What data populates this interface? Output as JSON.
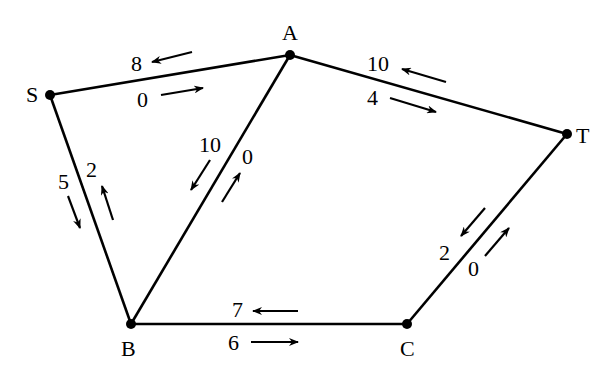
{
  "diagram": {
    "type": "flow-network",
    "nodes": [
      {
        "id": "S",
        "label": "S",
        "x": 50,
        "y": 95,
        "lx": 26,
        "ly": 102
      },
      {
        "id": "A",
        "label": "A",
        "x": 290,
        "y": 55,
        "lx": 282,
        "ly": 40
      },
      {
        "id": "T",
        "label": "T",
        "x": 567,
        "y": 134,
        "lx": 576,
        "ly": 143
      },
      {
        "id": "B",
        "label": "B",
        "x": 131,
        "y": 324,
        "lx": 121,
        "ly": 356
      },
      {
        "id": "C",
        "label": "C",
        "x": 407,
        "y": 324,
        "lx": 400,
        "ly": 356
      }
    ],
    "edges": [
      {
        "from": "S",
        "to": "A",
        "labels": [
          {
            "text": "8",
            "x": 131,
            "y": 71,
            "arrow": [
              192,
              52,
              152,
              62
            ]
          },
          {
            "text": "0",
            "x": 137,
            "y": 107,
            "arrow": [
              161,
              95,
              203,
              88
            ]
          }
        ]
      },
      {
        "from": "A",
        "to": "T",
        "labels": [
          {
            "text": "10",
            "x": 367,
            "y": 71,
            "arrow": [
              446,
              82,
              402,
              69
            ]
          },
          {
            "text": "4",
            "x": 367,
            "y": 105,
            "arrow": [
              390,
              98,
              436,
              112
            ]
          }
        ]
      },
      {
        "from": "S",
        "to": "B",
        "labels": [
          {
            "text": "5",
            "x": 58,
            "y": 189,
            "arrow": [
              68,
              196,
              80,
              228
            ]
          },
          {
            "text": "2",
            "x": 86,
            "y": 177,
            "arrow": [
              113,
              220,
              102,
              186
            ]
          }
        ]
      },
      {
        "from": "A",
        "to": "B",
        "labels": [
          {
            "text": "10",
            "x": 199,
            "y": 152,
            "arrow": [
              210,
              160,
              191,
              190
            ]
          },
          {
            "text": "0",
            "x": 242,
            "y": 164,
            "arrow": [
              222,
              202,
              240,
              173
            ]
          }
        ]
      },
      {
        "from": "B",
        "to": "C",
        "labels": [
          {
            "text": "7",
            "x": 232,
            "y": 317,
            "arrow": [
              298,
              311,
              253,
              311
            ]
          },
          {
            "text": "6",
            "x": 228,
            "y": 350,
            "arrow": [
              251,
              342,
              298,
              342
            ]
          }
        ]
      },
      {
        "from": "T",
        "to": "C",
        "labels": [
          {
            "text": "2",
            "x": 439,
            "y": 260,
            "arrow": [
              485,
              208,
              461,
              236
            ]
          },
          {
            "text": "0",
            "x": 468,
            "y": 276,
            "arrow": [
              485,
              256,
              509,
              228
            ]
          }
        ]
      }
    ]
  }
}
